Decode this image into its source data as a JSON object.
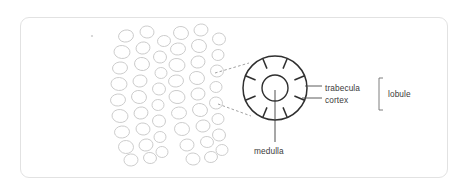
{
  "figure": {
    "kind": "anatomical-diagram",
    "frame_color": "#e2e2e2",
    "background": "#ffffff"
  },
  "labels": {
    "trabecula": "trabecula",
    "cortex": "cortex",
    "lobule": "lobule",
    "medulla": "medulla"
  },
  "diagram": {
    "overview": {
      "name": "lobule-cluster",
      "description": "cluster of irregular rounded lobules",
      "stroke": "#c9c9c9",
      "fill": "#ffffff",
      "blob_count": 44,
      "blobs": [
        [
          126,
          36,
          15,
          12,
          -12
        ],
        [
          147,
          32,
          14,
          12,
          8
        ],
        [
          164,
          41,
          13,
          11,
          -6
        ],
        [
          122,
          52,
          16,
          13,
          6
        ],
        [
          143,
          48,
          14,
          12,
          -14
        ],
        [
          160,
          57,
          13,
          12,
          10
        ],
        [
          120,
          68,
          15,
          12,
          -8
        ],
        [
          142,
          64,
          15,
          13,
          12
        ],
        [
          161,
          73,
          12,
          11,
          -5
        ],
        [
          119,
          84,
          16,
          13,
          5
        ],
        [
          140,
          81,
          14,
          12,
          -10
        ],
        [
          159,
          89,
          13,
          12,
          8
        ],
        [
          118,
          100,
          15,
          12,
          -7
        ],
        [
          139,
          97,
          15,
          13,
          11
        ],
        [
          158,
          105,
          12,
          11,
          -4
        ],
        [
          120,
          116,
          16,
          13,
          7
        ],
        [
          141,
          113,
          14,
          12,
          -12
        ],
        [
          159,
          121,
          13,
          12,
          9
        ],
        [
          122,
          132,
          15,
          12,
          -6
        ],
        [
          143,
          129,
          14,
          12,
          10
        ],
        [
          160,
          137,
          12,
          11,
          -8
        ],
        [
          126,
          147,
          15,
          13,
          5
        ],
        [
          146,
          145,
          14,
          12,
          -11
        ],
        [
          162,
          152,
          12,
          11,
          7
        ],
        [
          131,
          160,
          14,
          12,
          -5
        ],
        [
          150,
          158,
          13,
          11,
          9
        ],
        [
          181,
          33,
          15,
          13,
          10
        ],
        [
          201,
          30,
          14,
          12,
          -8
        ],
        [
          219,
          39,
          13,
          12,
          6
        ],
        [
          178,
          49,
          15,
          12,
          -6
        ],
        [
          199,
          46,
          15,
          13,
          11
        ],
        [
          218,
          55,
          12,
          11,
          -9
        ],
        [
          177,
          65,
          16,
          13,
          8
        ],
        [
          198,
          62,
          14,
          12,
          -12
        ],
        [
          217,
          71,
          13,
          12,
          5
        ],
        [
          176,
          81,
          15,
          12,
          -7
        ],
        [
          197,
          78,
          15,
          13,
          10
        ],
        [
          216,
          87,
          12,
          11,
          -6
        ],
        [
          177,
          97,
          16,
          13,
          9
        ],
        [
          198,
          94,
          14,
          12,
          -11
        ],
        [
          216,
          103,
          13,
          12,
          7
        ],
        [
          179,
          113,
          15,
          12,
          -5
        ],
        [
          200,
          110,
          15,
          13,
          12
        ],
        [
          218,
          119,
          12,
          11,
          -8
        ],
        [
          182,
          129,
          15,
          13,
          6
        ],
        [
          203,
          126,
          14,
          12,
          -10
        ],
        [
          219,
          135,
          13,
          12,
          9
        ],
        [
          187,
          145,
          14,
          12,
          -6
        ],
        [
          207,
          142,
          13,
          11,
          8
        ],
        [
          222,
          150,
          12,
          11,
          -5
        ],
        [
          193,
          159,
          14,
          12,
          7
        ],
        [
          211,
          157,
          13,
          11,
          -9
        ]
      ]
    },
    "detail": {
      "name": "lobule-cross-section",
      "stroke": "#2f2f2f",
      "center": [
        275,
        88
      ],
      "outer_radius": 32,
      "inner_radius": 13,
      "trabecula_ticks": 8,
      "tick_length": 11
    },
    "magnification_lines": {
      "style": "dashed",
      "stroke": "#8a8a8a",
      "from_top": [
        215,
        73
      ],
      "to_top": [
        249,
        63
      ],
      "from_bottom": [
        218,
        104
      ],
      "to_bottom": [
        251,
        116
      ]
    },
    "leaders": {
      "trabecula": [
        305,
        86,
        322,
        86
      ],
      "cortex": [
        302,
        98,
        322,
        98
      ],
      "medulla": [
        275,
        90,
        275,
        142
      ]
    },
    "bracket": {
      "x": 379,
      "top": 78,
      "bottom": 110,
      "serif": 4,
      "stroke": "#6f6f6f"
    },
    "speck": {
      "x": 92,
      "y": 36,
      "r": 1.1,
      "color": "#cfcfcf"
    }
  }
}
